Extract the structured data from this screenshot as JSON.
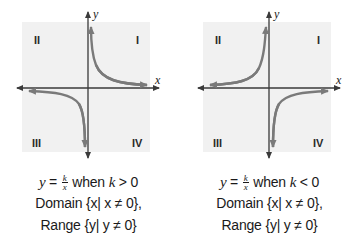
{
  "figures": [
    {
      "id": "positive-k",
      "axes": {
        "x_label": "x",
        "y_label": "y"
      },
      "quadrants": {
        "I": "I",
        "II": "II",
        "III": "III",
        "IV": "IV"
      },
      "curve_quadrants": [
        "I",
        "III"
      ],
      "caption": {
        "lhs": "y",
        "eq": " = ",
        "frac_num": "k",
        "frac_den": "x",
        "condition_word": " when ",
        "condition_var": "k",
        "condition_op": " > 0",
        "domain_label": "Domain ",
        "domain_set": "{x| x ≠ 0},",
        "range_label": "Range ",
        "range_set": "{y| y ≠ 0}"
      }
    },
    {
      "id": "negative-k",
      "axes": {
        "x_label": "x",
        "y_label": "y"
      },
      "quadrants": {
        "I": "I",
        "II": "II",
        "III": "III",
        "IV": "IV"
      },
      "curve_quadrants": [
        "II",
        "IV"
      ],
      "caption": {
        "lhs": "y",
        "eq": " = ",
        "frac_num": "k",
        "frac_den": "x",
        "condition_word": " when ",
        "condition_var": "k",
        "condition_op": " < 0",
        "domain_label": "Domain ",
        "domain_set": "{x| x ≠ 0},",
        "range_label": "Range ",
        "range_set": "{y| y ≠ 0}"
      }
    }
  ],
  "colors": {
    "grid_background": "#f1f1f1",
    "axis": "#3a3a3a",
    "curve": "#7a7a7a",
    "text": "#1a1a1a"
  }
}
